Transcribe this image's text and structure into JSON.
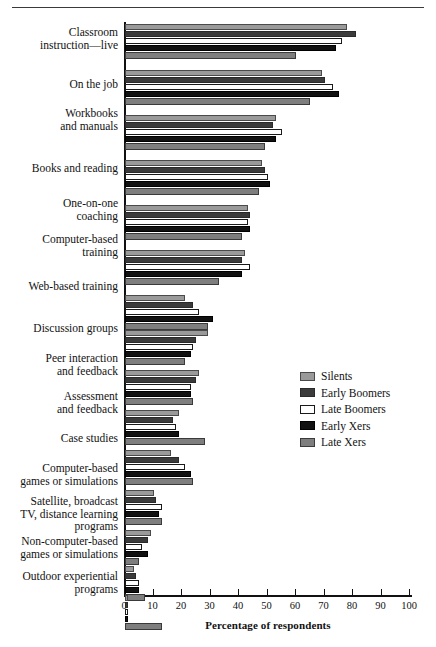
{
  "figure": {
    "x_axis_title": "Percentage of respondents"
  },
  "legend": {
    "items": [
      {
        "label": "Silents",
        "color": "#9a9a9a"
      },
      {
        "label": "Early Boomers",
        "color": "#3b3b3b"
      },
      {
        "label": "Late Boomers",
        "color": "#ffffff"
      },
      {
        "label": "Early Xers",
        "color": "#111111"
      },
      {
        "label": "Late Xers",
        "color": "#7e7e7e"
      }
    ]
  },
  "axis": {
    "ticks": [
      0,
      10,
      20,
      30,
      40,
      50,
      60,
      70,
      80,
      90,
      100
    ]
  },
  "chart_data": {
    "type": "bar",
    "orientation": "horizontal",
    "title": "",
    "xlabel": "Percentage of respondents",
    "ylabel": "",
    "xlim": [
      0,
      100
    ],
    "grid": false,
    "legend_position": "middle-right",
    "categories": [
      "Classroom instruction—live",
      "On the job",
      "Workbooks and manuals",
      "Books and reading",
      "One-on-one coaching",
      "Computer-based training",
      "Web-based training",
      "Discussion groups",
      "Peer interaction and feedback",
      "Assessment and feedback",
      "Case studies",
      "Computer-based games or simulations",
      "Satellite, broadcast TV, distance learning programs",
      "Non-computer-based games or simulations",
      "Outdoor experiential programs"
    ],
    "category_lines": [
      [
        "Classroom",
        "instruction—live"
      ],
      [
        "On the job"
      ],
      [
        "Workbooks",
        "and manuals"
      ],
      [
        "Books and reading"
      ],
      [
        "One-on-one",
        "coaching"
      ],
      [
        "Computer-based",
        "training"
      ],
      [
        "Web-based training"
      ],
      [
        "Discussion groups"
      ],
      [
        "Peer interaction",
        "and feedback"
      ],
      [
        "Assessment",
        "and feedback"
      ],
      [
        "Case studies"
      ],
      [
        "Computer-based",
        "games or simulations"
      ],
      [
        "Satellite, broadcast",
        "TV, distance learning",
        "programs"
      ],
      [
        "Non-computer-based",
        "games or simulations"
      ],
      [
        "Outdoor experiential",
        "programs"
      ]
    ],
    "series": [
      {
        "name": "Silents",
        "values": [
          78,
          69,
          53,
          48,
          43,
          42,
          21,
          29,
          26,
          19,
          16,
          10,
          9,
          3,
          1
        ]
      },
      {
        "name": "Early Boomers",
        "values": [
          81,
          70,
          52,
          49,
          44,
          41,
          24,
          25,
          25,
          17,
          19,
          11,
          8,
          4,
          1
        ]
      },
      {
        "name": "Late Boomers",
        "values": [
          76,
          73,
          55,
          50,
          43,
          44,
          26,
          24,
          23,
          18,
          21,
          13,
          6,
          5,
          1
        ]
      },
      {
        "name": "Early Xers",
        "values": [
          74,
          75,
          53,
          51,
          44,
          41,
          31,
          23,
          23,
          19,
          23,
          12,
          8,
          5,
          1
        ]
      },
      {
        "name": "Late Xers",
        "values": [
          60,
          65,
          49,
          47,
          41,
          33,
          29,
          21,
          24,
          28,
          24,
          13,
          5,
          7,
          13
        ]
      }
    ]
  },
  "layout": {
    "group_tops": [
      24,
      70,
      115,
      160,
      205,
      250,
      295,
      330,
      370,
      410,
      450,
      490,
      530,
      566,
      595
    ],
    "label_tops": [
      26,
      78,
      107,
      162,
      197,
      233,
      280,
      322,
      352,
      390,
      432,
      462,
      495,
      535,
      570
    ]
  }
}
